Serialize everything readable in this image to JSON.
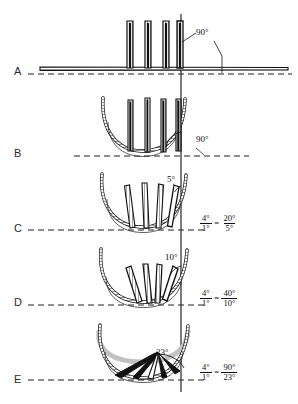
{
  "figure": {
    "axis": {
      "name": "vertical-reference-axis",
      "x": 181,
      "y_top": 14,
      "y_bottom": 392
    },
    "colors": {
      "ink": "#1a1a1a",
      "stroke": "#111111",
      "dashed": "#222222",
      "ghost": "#b9b9b9",
      "hatch": "#4a4a4a",
      "background": "#ffffff"
    },
    "panels": [
      {
        "letter": "A",
        "letter_x": 14,
        "letter_y": 65,
        "baseline_y": 74,
        "baseline_x1": 28,
        "baseline_x2": 292,
        "angle_label": "90°",
        "angle_label_x": 196,
        "angle_label_y": 34,
        "element_angle_deg": 0,
        "element_count": 4,
        "arc_type": "flat",
        "ratio": null
      },
      {
        "letter": "B",
        "letter_x": 14,
        "letter_y": 147,
        "baseline_y": 156,
        "baseline_x1": 74,
        "baseline_x2": 249,
        "angle_label": "90°",
        "angle_label_x": 196,
        "angle_label_y": 141,
        "element_angle_deg": 0,
        "element_count": 4,
        "arc_type": "u-curve",
        "ratio": null
      },
      {
        "letter": "C",
        "letter_x": 14,
        "letter_y": 222,
        "baseline_y": 230,
        "baseline_x1": 28,
        "baseline_x2": 205,
        "angle_label": "5°",
        "angle_label_x": 169,
        "angle_label_y": 180,
        "element_angle_deg": 5,
        "element_count": 4,
        "arc_type": "u-curve",
        "ratio": {
          "left_num": "4°",
          "left_den": "1°",
          "right_num": "20°",
          "right_den": "5°",
          "x": 200,
          "y": 222
        }
      },
      {
        "letter": "D",
        "letter_x": 14,
        "letter_y": 296,
        "baseline_y": 305,
        "baseline_x1": 28,
        "baseline_x2": 205,
        "angle_label": "10°",
        "angle_label_x": 167,
        "angle_label_y": 258,
        "element_angle_deg": 10,
        "element_count": 4,
        "arc_type": "u-curve",
        "ratio": {
          "left_num": "4°",
          "left_den": "1°",
          "right_num": "40°",
          "right_den": "10°",
          "x": 200,
          "y": 297
        }
      },
      {
        "letter": "E",
        "letter_x": 14,
        "letter_y": 373,
        "baseline_y": 380,
        "baseline_x1": 28,
        "baseline_x2": 205,
        "angle_label": "23°",
        "angle_label_x": 158,
        "angle_label_y": 353,
        "element_angle_deg": 23,
        "element_count": 5,
        "arc_type": "u-curve-fan",
        "ratio": {
          "left_num": "4°",
          "left_den": "1°",
          "right_num": "90°",
          "right_den": "23°",
          "x": 200,
          "y": 371
        }
      }
    ]
  }
}
